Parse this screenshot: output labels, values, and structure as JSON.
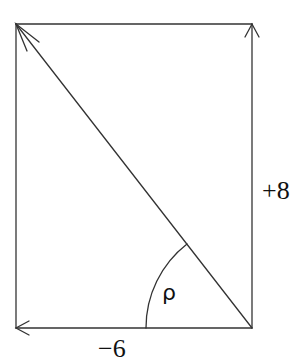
{
  "diagram": {
    "type": "vector-components",
    "rectangle": {
      "x1": 16,
      "y1": 24,
      "x2": 252,
      "y2": 328
    },
    "origin_corner": "bottom-right",
    "vectors": [
      {
        "name": "horizontal-component",
        "direction": "left",
        "label": "−6"
      },
      {
        "name": "vertical-component",
        "direction": "up",
        "label": "+8"
      },
      {
        "name": "resultant",
        "direction": "up-left diagonal",
        "label": ""
      }
    ],
    "angle": {
      "label": "ρ",
      "between": [
        "resultant",
        "horizontal-component"
      ]
    },
    "labels": {
      "angle": "ρ",
      "horizontal": "−6",
      "vertical": "+8"
    },
    "colors": {
      "stroke": "#333333",
      "background": "#ffffff",
      "text": "#111111"
    }
  }
}
